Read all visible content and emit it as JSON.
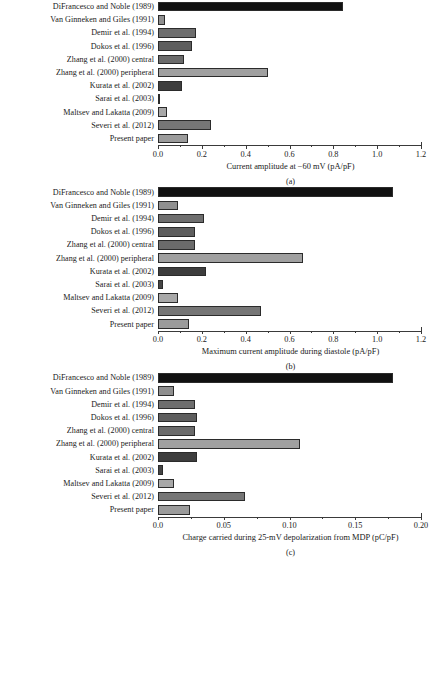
{
  "categories": [
    "DiFrancesco and Noble (1989)",
    "Van Ginneken and Giles (1991)",
    "Demir et al. (1994)",
    "Dokos et al. (1996)",
    "Zhang et al. (2000) central",
    "Zhang et al. (2000) peripheral",
    "Kurata et al. (2002)",
    "Sarai et al. (2003)",
    "Maltsev and Lakatta (2009)",
    "Severi et al. (2012)",
    "Present paper"
  ],
  "bar_colors": [
    "#111111",
    "#8f8f8f",
    "#6e6e6e",
    "#5e5e5e",
    "#6b6b6b",
    "#a0a0a0",
    "#3d3d3d",
    "#454545",
    "#a8a8a8",
    "#767676",
    "#9b9b9b"
  ],
  "panels": [
    {
      "caption": "(a)",
      "xlabel": "Current amplitude at −60 mV (pA/pF)",
      "ticklabels": [
        "0.0",
        "0.2",
        "0.4",
        "0.6",
        "0.8",
        "1.0",
        "1.2"
      ]
    },
    {
      "caption": "(b)",
      "xlabel": "Maximum current amplitude during diastole (pA/pF)",
      "ticklabels": [
        "0.0",
        "0.2",
        "0.4",
        "0.6",
        "0.8",
        "1.0",
        "1.2"
      ]
    },
    {
      "caption": "(c)",
      "xlabel": "Charge carried during 25-mV depolarization from MDP (pC/pF)",
      "ticklabels": [
        "0.0",
        "0.05",
        "0.10",
        "0.15",
        "0.20"
      ]
    }
  ],
  "chart_data": [
    {
      "type": "bar",
      "orientation": "horizontal",
      "panel": "(a)",
      "title": "",
      "xlabel": "Current amplitude at −60 mV (pA/pF)",
      "ylabel": "",
      "xlim": [
        0.0,
        1.2
      ],
      "xticks": [
        0.0,
        0.2,
        0.4,
        0.6,
        0.8,
        1.0,
        1.2
      ],
      "grid": false,
      "legend": "none",
      "categories": [
        "DiFrancesco and Noble (1989)",
        "Van Ginneken and Giles (1991)",
        "Demir et al. (1994)",
        "Dokos et al. (1996)",
        "Zhang et al. (2000) central",
        "Zhang et al. (2000) peripheral",
        "Kurata et al. (2002)",
        "Sarai et al. (2003)",
        "Maltsev and Lakatta (2009)",
        "Severi et al. (2012)",
        "Present paper"
      ],
      "values": [
        0.845,
        0.03,
        0.175,
        0.155,
        0.12,
        0.5,
        0.11,
        0.01,
        0.04,
        0.24,
        0.135
      ]
    },
    {
      "type": "bar",
      "orientation": "horizontal",
      "panel": "(b)",
      "title": "",
      "xlabel": "Maximum current amplitude during diastole (pA/pF)",
      "ylabel": "",
      "xlim": [
        0.0,
        1.2
      ],
      "xticks": [
        0.0,
        0.2,
        0.4,
        0.6,
        0.8,
        1.0,
        1.2
      ],
      "grid": false,
      "legend": "none",
      "categories": [
        "DiFrancesco and Noble (1989)",
        "Van Ginneken and Giles (1991)",
        "Demir et al. (1994)",
        "Dokos et al. (1996)",
        "Zhang et al. (2000) central",
        "Zhang et al. (2000) peripheral",
        "Kurata et al. (2002)",
        "Sarai et al. (2003)",
        "Maltsev and Lakatta (2009)",
        "Severi et al. (2012)",
        "Present paper"
      ],
      "values": [
        1.07,
        0.09,
        0.21,
        0.17,
        0.17,
        0.66,
        0.22,
        0.025,
        0.09,
        0.47,
        0.14
      ]
    },
    {
      "type": "bar",
      "orientation": "horizontal",
      "panel": "(c)",
      "title": "",
      "xlabel": "Charge carried during 25-mV depolarization from MDP (pC/pF)",
      "ylabel": "",
      "xlim": [
        0.0,
        0.2
      ],
      "xticks": [
        0.0,
        0.05,
        0.1,
        0.15,
        0.2
      ],
      "grid": false,
      "legend": "none",
      "categories": [
        "DiFrancesco and Noble (1989)",
        "Van Ginneken and Giles (1991)",
        "Demir et al. (1994)",
        "Dokos et al. (1996)",
        "Zhang et al. (2000) central",
        "Zhang et al. (2000) peripheral",
        "Kurata et al. (2002)",
        "Sarai et al. (2003)",
        "Maltsev and Lakatta (2009)",
        "Severi et al. (2012)",
        "Present paper"
      ],
      "values": [
        0.179,
        0.012,
        0.028,
        0.03,
        0.028,
        0.108,
        0.03,
        0.004,
        0.012,
        0.066,
        0.024
      ]
    }
  ]
}
